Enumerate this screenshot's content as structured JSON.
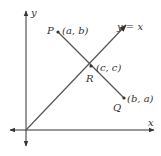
{
  "diagram": {
    "axes": {
      "x_label": "x",
      "y_label": "y"
    },
    "line_label": "y = x",
    "points": {
      "P": {
        "name": "P",
        "coords": "(a, b)"
      },
      "R": {
        "name": "R",
        "coords": "(c, c)"
      },
      "Q": {
        "name": "Q",
        "coords": "(b, a)"
      }
    },
    "colors": {
      "axis": "#333333",
      "line": "#555555",
      "point": "#333333"
    }
  }
}
